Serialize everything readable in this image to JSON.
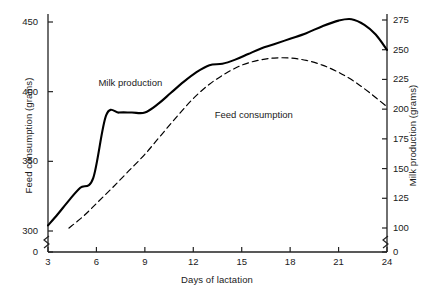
{
  "chart_data": {
    "type": "line",
    "title": "",
    "xlabel": "Days of lactation",
    "ylabel": "Feed consumption (grams)",
    "ylabel_right": "Milk production (grams)",
    "xlim": [
      3,
      24
    ],
    "xticks": [
      "3",
      "6",
      "9",
      "12",
      "15",
      "18",
      "21",
      "24"
    ],
    "xtick_values": [
      3,
      6,
      9,
      12,
      15,
      18,
      21,
      24
    ],
    "ylim_left": [
      290,
      460
    ],
    "yticks_left": [
      "0",
      "300",
      "350",
      "400",
      "450"
    ],
    "ytick_values_left": [
      0,
      300,
      350,
      400,
      450
    ],
    "ylim_right": [
      95,
      285
    ],
    "yticks_right": [
      "0",
      "100",
      "125",
      "150",
      "175",
      "200",
      "225",
      "250",
      "275"
    ],
    "ytick_values_right": [
      0,
      100,
      125,
      150,
      175,
      200,
      225,
      250,
      275
    ],
    "axis_break_left": true,
    "axis_break_right": true,
    "grid": false,
    "legend_position": "inline-annotations",
    "series": [
      {
        "name": "Feed consumption",
        "axis": "left",
        "style": "solid",
        "color": "#000000",
        "label_x": 15.0,
        "label_y": 383,
        "x": [
          3,
          3.6,
          4.3,
          5.0,
          5.8,
          6.6,
          7.4,
          8.2,
          9.0,
          9.8,
          10.6,
          11.4,
          12.2,
          13.0,
          13.8,
          14.6,
          15.4,
          16.2,
          17.0,
          18.0,
          19.0,
          20.0,
          21.0,
          21.8,
          22.6,
          23.3,
          24
        ],
        "y": [
          304,
          312,
          322,
          331,
          338,
          383,
          385,
          385,
          385,
          391,
          399,
          407,
          414,
          419,
          420,
          423,
          427,
          431,
          434,
          438,
          442,
          447,
          451,
          452,
          448,
          441,
          430
        ]
      },
      {
        "name": "Milk production",
        "axis": "right",
        "style": "dashed",
        "color": "#000000",
        "label_x": 8.6,
        "label_y": 222,
        "x": [
          4.3,
          5.2,
          6.1,
          7.0,
          8.0,
          9.0,
          10.0,
          11.0,
          12.0,
          13.0,
          14.0,
          15.0,
          16.0,
          17.0,
          18.0,
          19.0,
          20.0,
          21.0,
          22.0,
          23.0,
          24
        ],
        "y": [
          100,
          110,
          122,
          134,
          148,
          162,
          178,
          194,
          209,
          221,
          230,
          237,
          241,
          243,
          243,
          241,
          237,
          231,
          223,
          213,
          202
        ]
      }
    ]
  },
  "annotations": {
    "milk_label": "Milk production",
    "feed_label": "Feed consumption"
  }
}
